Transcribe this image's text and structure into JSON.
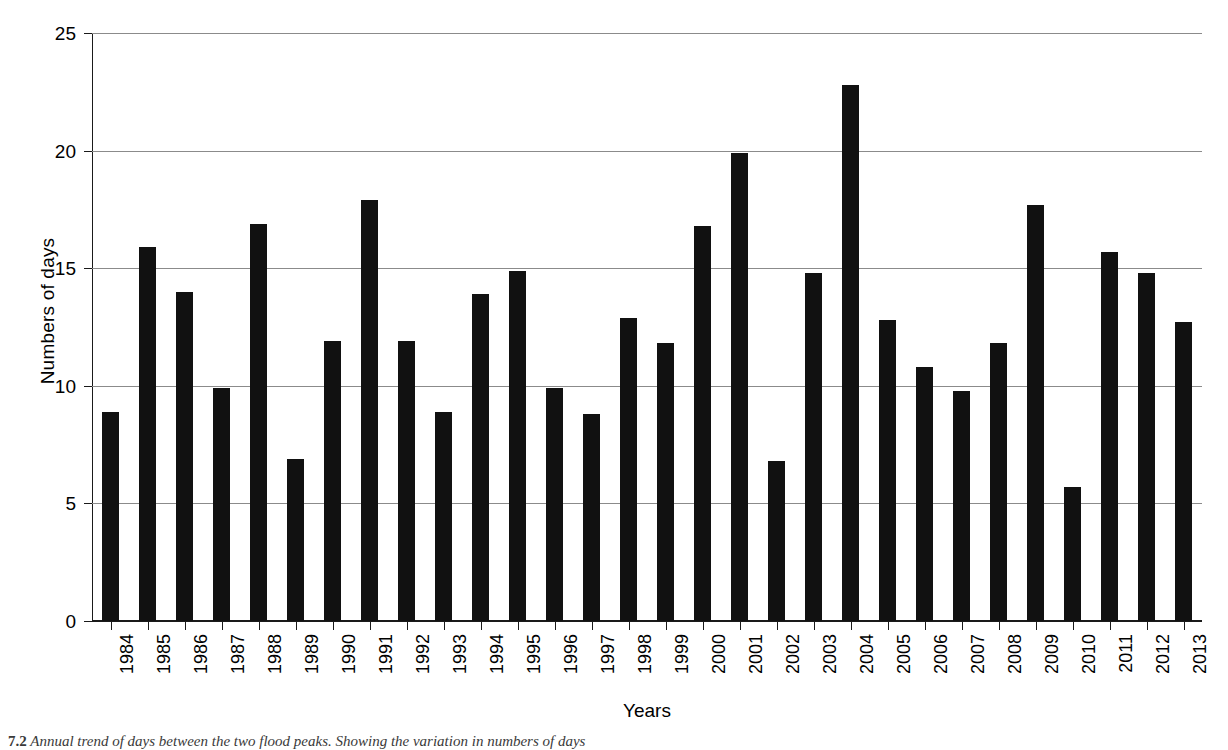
{
  "chart_data": {
    "type": "bar",
    "title": "",
    "xlabel": "Years",
    "ylabel": "Numbers of days",
    "ylim": [
      0,
      25
    ],
    "yticks": [
      0,
      5,
      10,
      15,
      20,
      25
    ],
    "grid": true,
    "legend": "none",
    "bar_color": "#111111",
    "grid_color": "#8b8b8b",
    "axis_color": "#1a1a1a",
    "categories": [
      "1984",
      "1985",
      "1986",
      "1987",
      "1988",
      "1989",
      "1990",
      "1991",
      "1992",
      "1993",
      "1994",
      "1995",
      "1996",
      "1997",
      "1998",
      "1999",
      "2000",
      "2001",
      "2002",
      "2003",
      "2004",
      "2005",
      "2006",
      "2007",
      "2008",
      "2009",
      "2010",
      "2011",
      "2012",
      "2013"
    ],
    "values": [
      8.9,
      15.9,
      14.0,
      9.9,
      16.9,
      6.9,
      11.9,
      17.9,
      11.9,
      8.9,
      13.9,
      14.9,
      9.9,
      8.8,
      12.9,
      11.8,
      16.8,
      19.9,
      6.8,
      14.8,
      22.8,
      12.8,
      10.8,
      9.8,
      11.8,
      17.7,
      5.7,
      15.7,
      14.8,
      12.7
    ]
  },
  "axes": {
    "ylabel": "Numbers of days",
    "xlabel": "Years",
    "ytick_labels": [
      "25",
      "20",
      "15",
      "10",
      "5",
      "0"
    ]
  },
  "caption": {
    "number": "7.2",
    "text": "Annual trend of days between the two flood peaks. Showing the variation in numbers of days"
  }
}
